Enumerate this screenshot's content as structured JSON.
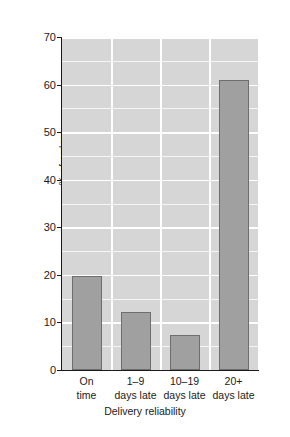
{
  "chart_data": {
    "type": "bar",
    "title": "",
    "xlabel": "Delivery reliability",
    "ylabel": "% of orders",
    "categories": [
      "On time",
      "1–9 days late",
      "10–19 days late",
      "20+ days late"
    ],
    "category_lines": [
      [
        "On",
        "time"
      ],
      [
        "1–9",
        "days late"
      ],
      [
        "10–19",
        "days late"
      ],
      [
        "20+",
        "days late"
      ]
    ],
    "values": [
      19.7,
      12.3,
      7.3,
      61.0
    ],
    "ylim": [
      0,
      70
    ],
    "ytick_labels": [
      "0",
      "10",
      "20",
      "30",
      "40",
      "50",
      "60",
      "70"
    ],
    "ytick_values": [
      0,
      10,
      20,
      30,
      40,
      50,
      60,
      70
    ],
    "minor_tick_step": 5,
    "grid": "horizontal-and-vertical",
    "legend": "none",
    "colors": {
      "bar_fill": "#a0a0a0",
      "bar_edge": "#6e6e6e",
      "plot_background": "#d6d6d6",
      "gridline": "#ffffff",
      "minor_gridline": "#f5f5f5",
      "axis": "#1a1a1a",
      "text": "#1a1a1a",
      "page_background": "#ffffff"
    }
  }
}
